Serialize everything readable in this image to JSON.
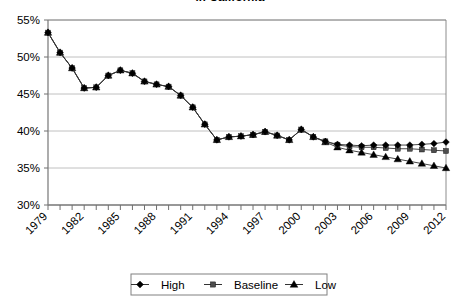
{
  "chart_data": {
    "type": "line",
    "title": "in California",
    "xlabel": "",
    "ylabel": "",
    "ylim": [
      30,
      55
    ],
    "ytick_labels": [
      "30%",
      "35%",
      "40%",
      "45%",
      "50%",
      "55%"
    ],
    "ytick_values": [
      30,
      35,
      40,
      45,
      50,
      55
    ],
    "grid": true,
    "legend_position": "bottom",
    "x": [
      1979,
      1980,
      1981,
      1982,
      1983,
      1984,
      1985,
      1986,
      1987,
      1988,
      1989,
      1990,
      1991,
      1992,
      1993,
      1994,
      1995,
      1996,
      1997,
      1998,
      1999,
      2000,
      2001,
      2002,
      2003,
      2004,
      2005,
      2006,
      2007,
      2008,
      2009,
      2010,
      2011,
      2012
    ],
    "xtick_labels": [
      "1979",
      "1982",
      "1985",
      "1988",
      "1991",
      "1994",
      "1997",
      "2000",
      "2003",
      "2006",
      "2009",
      "2012"
    ],
    "xtick_values": [
      1979,
      1982,
      1985,
      1988,
      1991,
      1994,
      1997,
      2000,
      2003,
      2006,
      2009,
      2012
    ],
    "series": [
      {
        "name": "High",
        "marker": "diamond",
        "color": "#000000",
        "values": [
          53.3,
          50.6,
          48.5,
          45.8,
          45.9,
          47.5,
          48.2,
          47.8,
          46.7,
          46.3,
          46.0,
          44.8,
          43.2,
          40.9,
          38.8,
          39.2,
          39.3,
          39.5,
          39.9,
          39.4,
          38.8,
          40.2,
          39.2,
          38.6,
          38.2,
          38.1,
          38.0,
          38.1,
          38.1,
          38.1,
          38.1,
          38.2,
          38.3,
          38.5
        ]
      },
      {
        "name": "Baseline",
        "marker": "square",
        "color": "#4d4d4d",
        "values": [
          53.3,
          50.6,
          48.5,
          45.8,
          45.9,
          47.5,
          48.2,
          47.8,
          46.7,
          46.3,
          46.0,
          44.8,
          43.2,
          40.9,
          38.8,
          39.2,
          39.3,
          39.5,
          39.9,
          39.4,
          38.8,
          40.2,
          39.2,
          38.6,
          38.1,
          37.9,
          37.8,
          37.8,
          37.7,
          37.6,
          37.6,
          37.5,
          37.4,
          37.3
        ]
      },
      {
        "name": "Low",
        "marker": "triangle",
        "color": "#000000",
        "values": [
          53.3,
          50.6,
          48.5,
          45.8,
          45.9,
          47.5,
          48.2,
          47.8,
          46.7,
          46.3,
          46.0,
          44.8,
          43.2,
          40.9,
          38.8,
          39.2,
          39.3,
          39.5,
          39.9,
          39.4,
          38.8,
          40.2,
          39.2,
          38.5,
          37.8,
          37.4,
          37.1,
          36.8,
          36.5,
          36.2,
          35.9,
          35.6,
          35.3,
          35.0
        ]
      }
    ]
  },
  "legend": {
    "items": [
      {
        "label": "High"
      },
      {
        "label": "Baseline"
      },
      {
        "label": "Low"
      }
    ]
  }
}
